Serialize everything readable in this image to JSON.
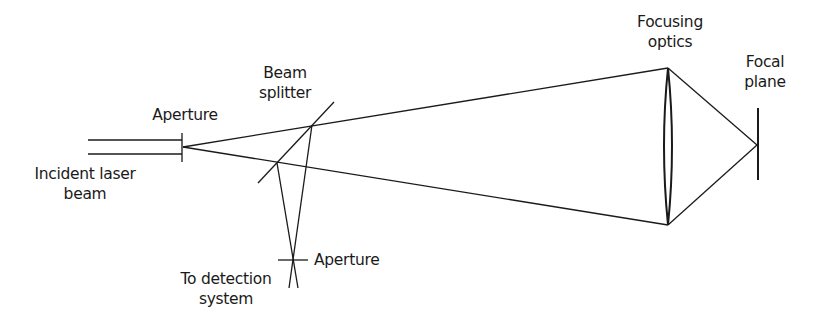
{
  "figure": {
    "type": "optical-schematic"
  },
  "labels": {
    "incident_beam": [
      "Incident laser",
      "beam"
    ],
    "aperture_input": "Aperture",
    "beam_splitter": [
      "Beam",
      "splitter"
    ],
    "focusing_optics": [
      "Focusing",
      "optics"
    ],
    "focal_plane": [
      "Focal",
      "plane"
    ],
    "aperture_detection": "Aperture",
    "detection": [
      "To detection",
      "system"
    ]
  },
  "colors": {
    "line": "#1a1a1a",
    "background": "#ffffff"
  }
}
